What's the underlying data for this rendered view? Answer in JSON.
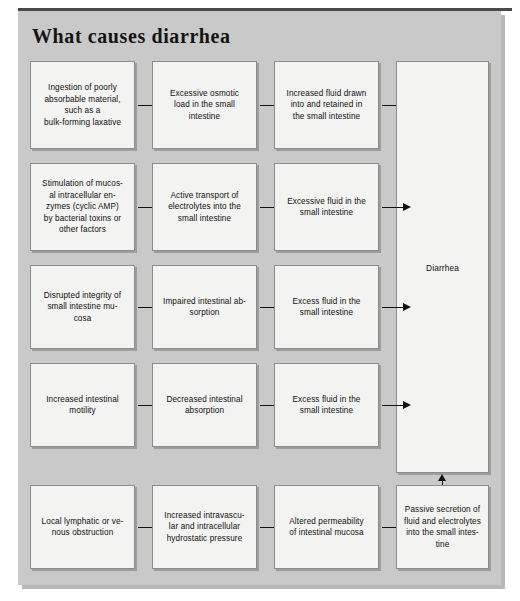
{
  "page": {
    "title": "What causes diarrhea",
    "background_color": "#ffffff",
    "panel_color": "#c9c9c9",
    "box_color": "#f3f3f1",
    "border_color": "#8c8c8c",
    "text_color": "#101010"
  },
  "diagram": {
    "type": "flowchart",
    "columns": 4,
    "rows": 5,
    "final_node": {
      "label": "Diarrhea",
      "spans_rows": [
        1,
        2,
        3,
        4
      ]
    },
    "rows_data": [
      {
        "row": 1,
        "boxes": [
          "Ingestion of poorly absorbable material, such as a bulk-forming laxative",
          "Excessive osmotic load in the small intestine",
          "Increased fluid drawn into and retained in the small intestine"
        ]
      },
      {
        "row": 2,
        "boxes": [
          "Stimulation of mucos-al intracellular en-zymes (cyclic AMP) by bacterial toxins or other factors",
          "Active transport of electrolytes into the small intestine",
          "Excessive fluid in the small intestine"
        ]
      },
      {
        "row": 3,
        "boxes": [
          "Disrupted integrity of small intestine mu-cosa",
          "Impaired intestinal ab-sorption",
          "Excess fluid in the small intestine"
        ]
      },
      {
        "row": 4,
        "boxes": [
          "Increased intestinal motility",
          "Decreased intestinal absorption",
          "Excess fluid in the small intestine"
        ]
      },
      {
        "row": 5,
        "boxes": [
          "Local lymphatic or ve-nous obstruction",
          "Increased intravascu-lar and intracellular hydrostatic pressure",
          "Altered permeability of intestinal mucosa",
          "Passive secretion of fluid and electrolytes into the small intes-tine"
        ]
      }
    ]
  },
  "nodes": {
    "r1c1": "Ingestion of poorly\nabsorbable material,\nsuch as a\nbulk-forming laxative",
    "r1c2": "Excessive osmotic\nload in the small\nintestine",
    "r1c3": "Increased fluid drawn\ninto and retained in\nthe small intestine",
    "r2c1": "Stimulation of mucos-\nal intracellular en-\nzymes (cyclic AMP)\nby bacterial toxins or\nother factors",
    "r2c2": "Active transport of\nelectrolytes into the\nsmall intestine",
    "r2c3": "Excessive fluid in the\nsmall intestine",
    "r3c1": "Disrupted integrity of\nsmall intestine mu-\ncosa",
    "r3c2": "Impaired intestinal ab-\nsorption",
    "r3c3": "Excess fluid in the\nsmall intestine",
    "r4c1": "Increased intestinal\nmotility",
    "r4c2": "Decreased intestinal\nabsorption",
    "r4c3": "Excess fluid in the\nsmall intestine",
    "r5c1": "Local lymphatic or ve-\nnous obstruction",
    "r5c2": "Increased intravascu-\nlar and intracellular\nhydrostatic pressure",
    "r5c3": "Altered permeability\nof intestinal mucosa",
    "r5c4": "Passive secretion of\nfluid and electrolytes\ninto the small intes-\ntine",
    "diarrhea": "Diarrhea"
  }
}
